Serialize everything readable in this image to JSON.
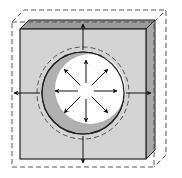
{
  "diagram": {
    "colors": {
      "background": "#ffffff",
      "block_front": "#d4d4d4",
      "block_side": "#a8a8a8",
      "block_top": "#9a9a9a",
      "crescent": "#b0b0b0",
      "cavity": "#ffffff",
      "outline": "#222222",
      "dashed": "#555555",
      "arrow": "#111111"
    },
    "block": {
      "front": {
        "x": 20,
        "y": 29,
        "w": 126,
        "h": 130
      },
      "depth_dx": 9,
      "depth_dy": -9
    },
    "dashed_box": {
      "front": {
        "x": 12,
        "y": 22,
        "w": 142,
        "h": 145
      },
      "depth_dx": 12,
      "depth_dy": -12
    },
    "circle": {
      "cx": 83,
      "cy": 93,
      "r": 41,
      "dashed_r": 46
    },
    "cavity": {
      "cx": 90,
      "cy": 89,
      "r": 35
    },
    "inner_arrows": [
      {
        "angle": -90,
        "from": 8,
        "to": 31
      },
      {
        "angle": -45,
        "from": 8,
        "to": 31
      },
      {
        "angle": 0,
        "from": 8,
        "to": 31
      },
      {
        "angle": 45,
        "from": 8,
        "to": 31
      },
      {
        "angle": 90,
        "from": 8,
        "to": 31
      },
      {
        "angle": 135,
        "from": 8,
        "to": 31
      },
      {
        "angle": 180,
        "from": 8,
        "to": 31
      },
      {
        "angle": -135,
        "from": 8,
        "to": 31
      }
    ],
    "outer_arrows": [
      {
        "direction": "up",
        "x1": 83,
        "y1": 50,
        "x2": 83,
        "y2": 24
      },
      {
        "direction": "down",
        "x1": 83,
        "y1": 136,
        "x2": 83,
        "y2": 163
      },
      {
        "direction": "left",
        "x1": 40,
        "y1": 93,
        "x2": 14,
        "y2": 93
      },
      {
        "direction": "right",
        "x1": 126,
        "y1": 93,
        "x2": 151,
        "y2": 93
      }
    ]
  }
}
